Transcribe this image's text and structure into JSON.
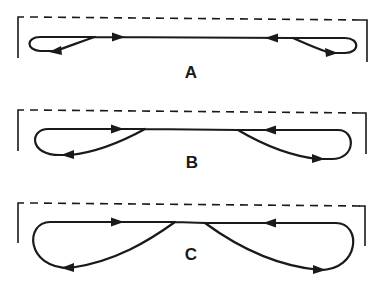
{
  "figure": {
    "stroke_color": "#1a1a1a",
    "background": "#ffffff",
    "panels": [
      {
        "id": "A",
        "label": "A"
      },
      {
        "id": "B",
        "label": "B"
      },
      {
        "id": "C",
        "label": "C"
      }
    ]
  }
}
